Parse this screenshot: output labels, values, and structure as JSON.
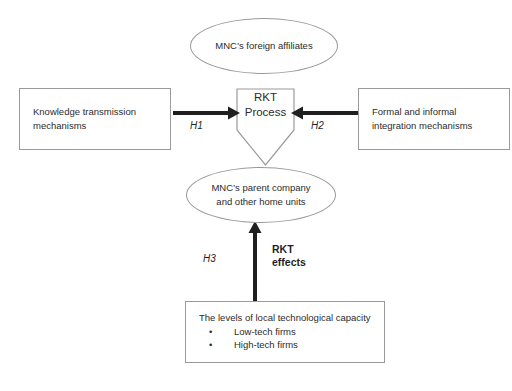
{
  "diagram": {
    "background_color": "#ffffff",
    "line_color": "#9a9a9a",
    "arrow_color": "#1f1f1f",
    "text_color": "#2b2b2b"
  },
  "nodes": {
    "top_ellipse": {
      "shape": "ellipse",
      "text": "MNC’s foreign affiliates"
    },
    "bottom_ellipse": {
      "shape": "ellipse",
      "text": "MNC’s parent company\nand other home units"
    },
    "center": {
      "shape": "pentagon-down",
      "text": "RKT\nProcess"
    },
    "left_box": {
      "shape": "rectangle",
      "text": "Knowledge transmission\n mechanisms"
    },
    "right_box": {
      "shape": "rectangle",
      "text": "Formal and informal\n integration mechanisms"
    },
    "bottom_box": {
      "shape": "rectangle",
      "lead": "The levels of local technological capacity",
      "bullets": [
        "Low-tech firms",
        "High-tech firms"
      ],
      "bullet_glyph": "•"
    }
  },
  "arrows": {
    "left_to_center": {
      "label": "H1",
      "direction": "right"
    },
    "right_to_center": {
      "label": "H2",
      "direction": "left"
    },
    "bottom_to_center": {
      "label": "H3",
      "direction": "up",
      "effect_label": "RKT\neffects"
    }
  }
}
